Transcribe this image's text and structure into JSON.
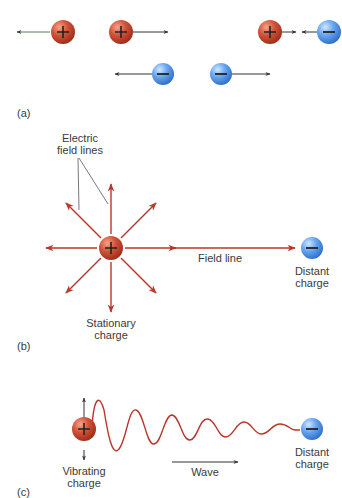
{
  "colors": {
    "positive": "#c9432c",
    "negative": "#4a8fe0",
    "field_line": "#b8372a",
    "arrow_dark": "#333333",
    "label": "#3a3a3a"
  },
  "panels": {
    "a": {
      "label": "(a)"
    },
    "b": {
      "label": "(b)",
      "electric_field_lines_line1": "Electric",
      "electric_field_lines_line2": "field lines",
      "field_line": "Field line",
      "stationary_charge_line1": "Stationary",
      "stationary_charge_line2": "charge",
      "distant_charge_line1": "Distant",
      "distant_charge_line2": "charge"
    },
    "c": {
      "label": "(c)",
      "vibrating_charge_line1": "Vibrating",
      "vibrating_charge_line2": "charge",
      "wave": "Wave",
      "distant_charge_line1": "Distant",
      "distant_charge_line2": "charge"
    }
  },
  "charges": {
    "positive_symbol": "+",
    "negative_symbol": "−"
  }
}
